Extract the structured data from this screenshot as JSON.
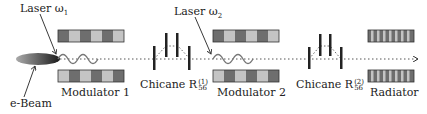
{
  "labels": {
    "laser1": "Laser ω",
    "laser1_sub": "1",
    "laser2": "Laser ω",
    "laser2_sub": "2",
    "ebeam": "e-Beam",
    "modulator1": "Modulator 1",
    "modulator2": "Modulator 2",
    "chicane1": "Chicane R",
    "chicane1_sub": "56",
    "chicane1_sup": "(1)",
    "chicane2": "Chicane R",
    "chicane2_sub": "56",
    "chicane2_sup": "(2)",
    "radiator": "Radiator"
  },
  "colors": {
    "dark_block": "#6e6e6e",
    "light_block": "#c4c4c4",
    "outline": "#333333",
    "beam_dark": "#2a2a2a",
    "beam_light": "#9a9a9a"
  }
}
